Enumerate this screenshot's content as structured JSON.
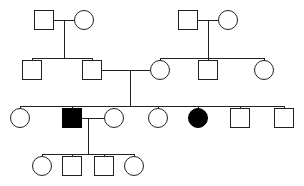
{
  "chart_data": {
    "type": "diagram",
    "diagram_type": "pedigree-chart",
    "title": "",
    "legend": {
      "male_symbol": "square",
      "female_symbol": "circle",
      "unaffected_fill": "#ffffff",
      "affected_fill": "#000000",
      "line_color": "#231f20",
      "background": "#ffffff"
    },
    "counts": {
      "generations": 4,
      "individuals": 21,
      "males": 11,
      "females": 10,
      "affected": 2,
      "unaffected": 19,
      "matings": 4
    },
    "generations": [
      {
        "id": "I",
        "label": "I",
        "y": 20,
        "individuals": [
          {
            "id": "I-1",
            "sex": "male",
            "symbol": "square",
            "affected": false,
            "x": 44,
            "y": 20,
            "size": 20
          },
          {
            "id": "I-2",
            "sex": "female",
            "symbol": "circle",
            "affected": false,
            "x": 84,
            "y": 20,
            "size": 20
          },
          {
            "id": "I-3",
            "sex": "male",
            "symbol": "square",
            "affected": false,
            "x": 188,
            "y": 20,
            "size": 20
          },
          {
            "id": "I-4",
            "sex": "female",
            "symbol": "circle",
            "affected": false,
            "x": 228,
            "y": 20,
            "size": 20
          }
        ]
      },
      {
        "id": "II",
        "label": "II",
        "y": 70,
        "individuals": [
          {
            "id": "II-1",
            "sex": "male",
            "symbol": "square",
            "affected": false,
            "x": 32,
            "y": 70,
            "size": 20
          },
          {
            "id": "II-2",
            "sex": "male",
            "symbol": "square",
            "affected": false,
            "x": 92,
            "y": 70,
            "size": 20
          },
          {
            "id": "II-3",
            "sex": "female",
            "symbol": "circle",
            "affected": false,
            "x": 160,
            "y": 70,
            "size": 20
          },
          {
            "id": "II-4",
            "sex": "male",
            "symbol": "square",
            "affected": false,
            "x": 208,
            "y": 70,
            "size": 20
          },
          {
            "id": "II-5",
            "sex": "female",
            "symbol": "circle",
            "affected": false,
            "x": 264,
            "y": 70,
            "size": 20
          }
        ]
      },
      {
        "id": "III",
        "label": "III",
        "y": 118,
        "individuals": [
          {
            "id": "III-1",
            "sex": "female",
            "symbol": "circle",
            "affected": false,
            "x": 20,
            "y": 118,
            "size": 20
          },
          {
            "id": "III-2",
            "sex": "male",
            "symbol": "square",
            "affected": true,
            "x": 72,
            "y": 118,
            "size": 20
          },
          {
            "id": "III-3",
            "sex": "female",
            "symbol": "circle",
            "affected": false,
            "x": 114,
            "y": 118,
            "size": 20
          },
          {
            "id": "III-4",
            "sex": "female",
            "symbol": "circle",
            "affected": false,
            "x": 158,
            "y": 118,
            "size": 20
          },
          {
            "id": "III-5",
            "sex": "female",
            "symbol": "circle",
            "affected": true,
            "x": 198,
            "y": 118,
            "size": 20
          },
          {
            "id": "III-6",
            "sex": "male",
            "symbol": "square",
            "affected": false,
            "x": 240,
            "y": 118,
            "size": 20
          },
          {
            "id": "III-7",
            "sex": "male",
            "symbol": "square",
            "affected": false,
            "x": 284,
            "y": 118,
            "size": 20
          }
        ]
      },
      {
        "id": "IV",
        "label": "IV",
        "y": 166,
        "individuals": [
          {
            "id": "IV-1",
            "sex": "female",
            "symbol": "circle",
            "affected": false,
            "x": 42,
            "y": 166,
            "size": 20
          },
          {
            "id": "IV-2",
            "sex": "male",
            "symbol": "square",
            "affected": false,
            "x": 72,
            "y": 166,
            "size": 20
          },
          {
            "id": "IV-3",
            "sex": "male",
            "symbol": "square",
            "affected": false,
            "x": 104,
            "y": 166,
            "size": 20
          },
          {
            "id": "IV-4",
            "sex": "female",
            "symbol": "circle",
            "affected": false,
            "x": 134,
            "y": 166,
            "size": 20
          }
        ]
      }
    ],
    "matings": [
      {
        "id": "mating-1",
        "partners": [
          "I-1",
          "I-2"
        ],
        "children": [
          "II-1",
          "II-2"
        ],
        "mating_line_y": 20,
        "descent_x": 64
      },
      {
        "id": "mating-2",
        "partners": [
          "I-3",
          "I-4"
        ],
        "children": [
          "II-3",
          "II-4",
          "II-5"
        ],
        "mating_line_y": 20,
        "descent_x": 208
      },
      {
        "id": "mating-3",
        "partners": [
          "II-2",
          "II-3"
        ],
        "children": [
          "III-1",
          "III-2",
          "III-3",
          "III-4",
          "III-5",
          "III-6",
          "III-7"
        ],
        "mating_line_y": 70,
        "descent_x": 130
      },
      {
        "id": "mating-4",
        "partners": [
          "III-2",
          "III-3"
        ],
        "children": [
          "IV-1",
          "IV-2",
          "IV-3",
          "IV-4"
        ],
        "mating_line_y": 118,
        "descent_x": 88
      }
    ]
  },
  "figure": {
    "caption": "",
    "alt_text": "Four-generation pedigree chart with squares for males and circles for females; two individuals are shaded to indicate affected status."
  }
}
